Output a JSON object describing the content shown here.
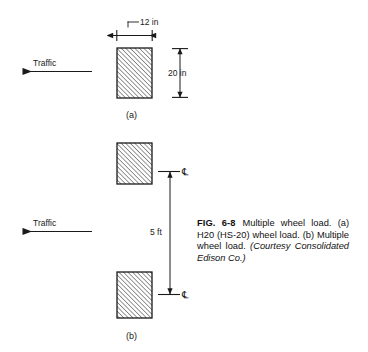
{
  "figure": {
    "panels": [
      {
        "id": "a",
        "label": "(a)",
        "traffic_label": "Traffic",
        "width_dim": "12 in",
        "height_dim": "20 in"
      },
      {
        "id": "b",
        "label": "(b)",
        "traffic_label": "Traffic",
        "spacing_dim": "5 ft",
        "centerline_symbol_top": "℄",
        "centerline_symbol_bottom": "℄"
      }
    ]
  },
  "caption": {
    "fig_number": "FIG. 6-8",
    "text_part1": "Multiple wheel load. (a) H20 (HS-20) wheel load. (b) Multiple wheel load.",
    "credit": "(Courtesy Consolidated Edison Co.)"
  },
  "colors": {
    "ink": "#1a1a1a",
    "background": "#ffffff"
  }
}
